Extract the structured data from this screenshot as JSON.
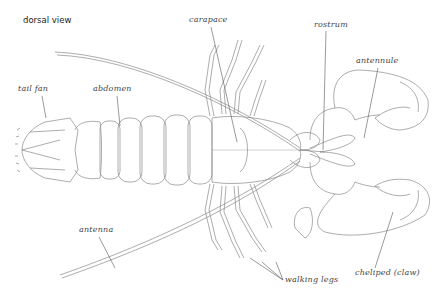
{
  "diagram": {
    "title": "dorsal view",
    "labels": {
      "tail_fan": "tail fan",
      "abdomen": "abdomen",
      "carapace": "carapace",
      "rostrum": "rostrum",
      "antennule": "antennule",
      "antenna": "antenna",
      "walking_legs": "walking legs",
      "cheliped": "cheliped (claw)"
    },
    "colors": {
      "line": "#8a8a8a",
      "leader": "#555555",
      "text": "#444444",
      "background": "#ffffff"
    }
  }
}
